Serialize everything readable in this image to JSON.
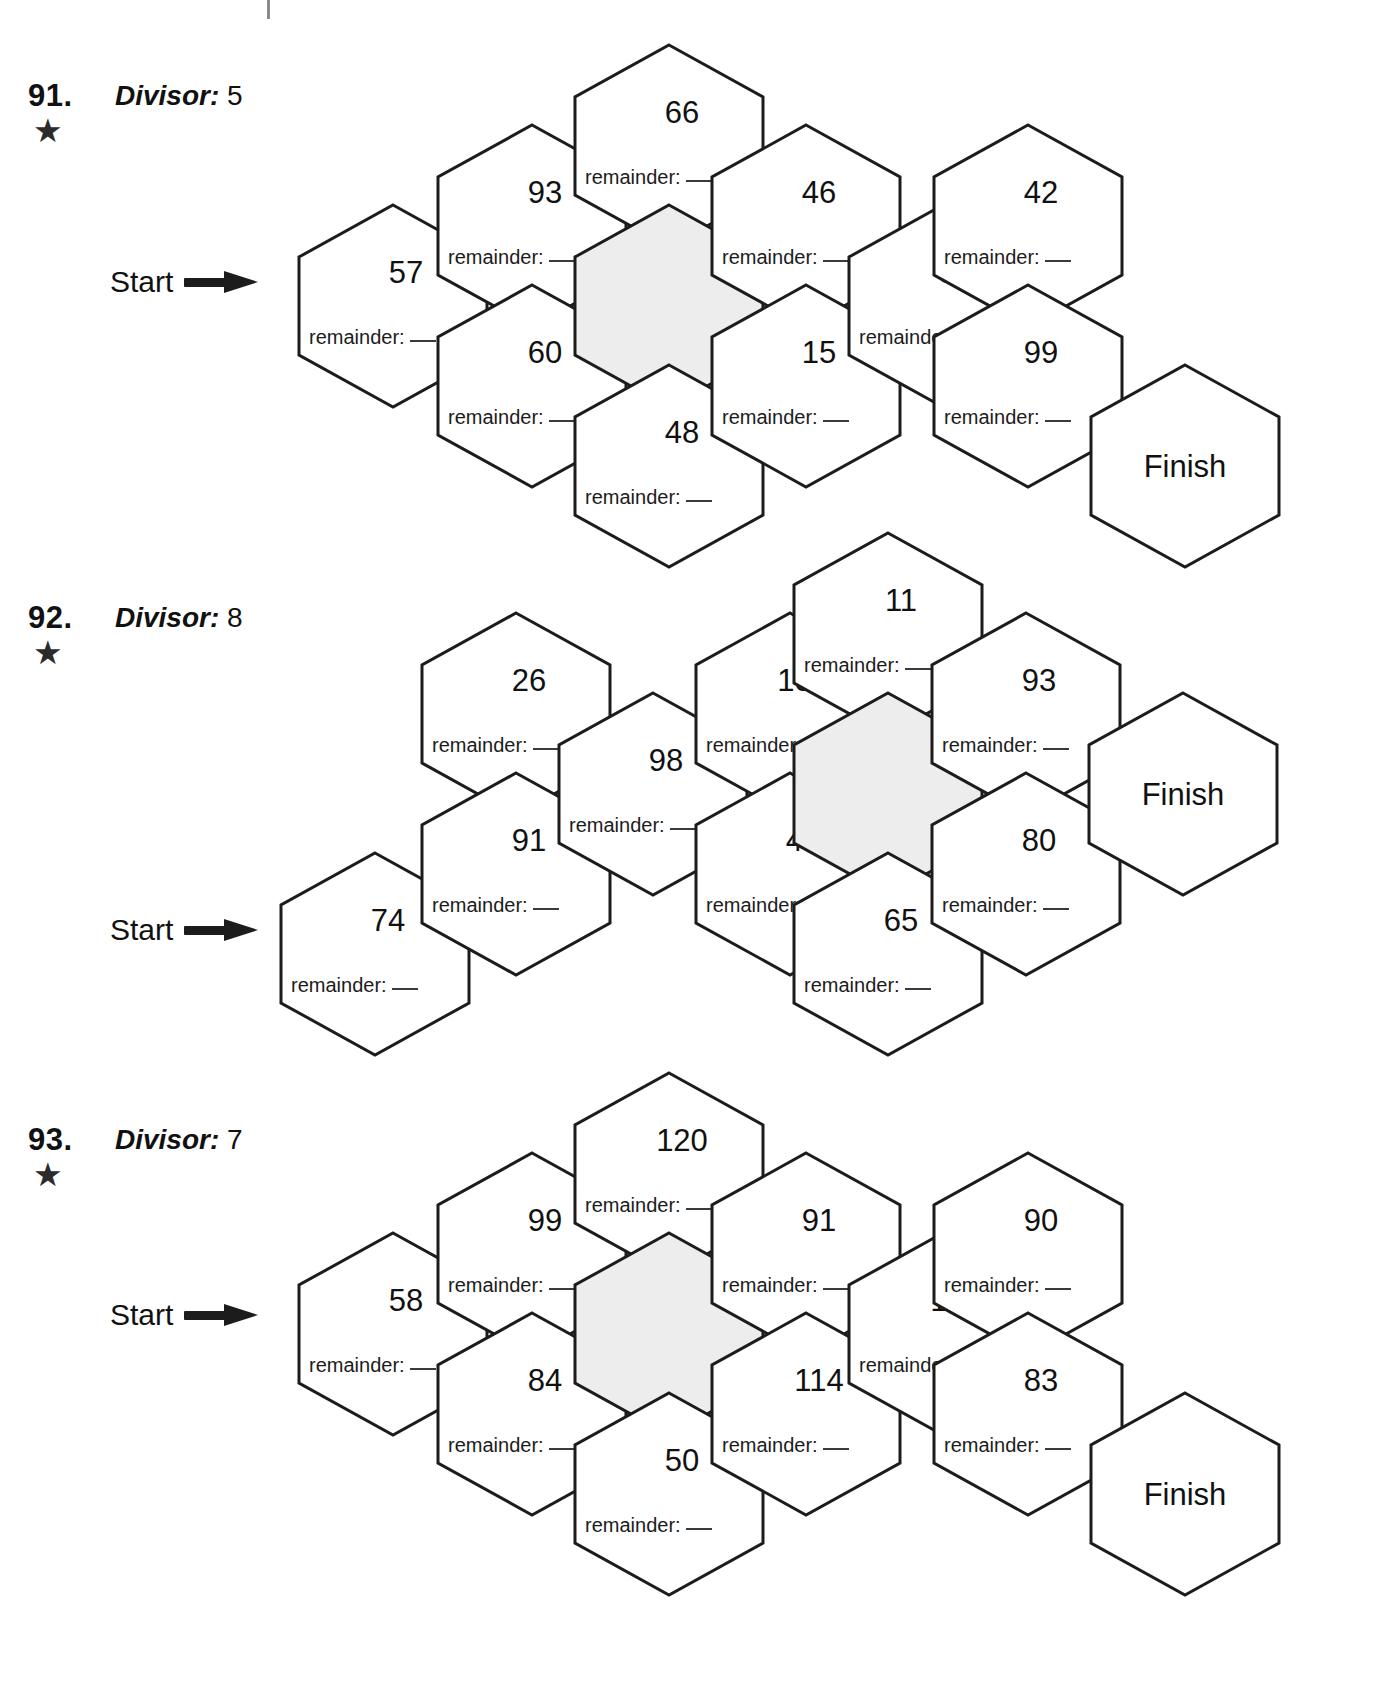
{
  "page": {
    "registration_tick": "crop-mark",
    "remainder_label": "remainder:",
    "start_label": "Start",
    "finish_label": "Finish",
    "star_glyph": "★",
    "divisor_word": "Divisor:",
    "shaded_fill": "#ededed",
    "stroke_color": "#1c1c1c",
    "text_color": "#111111"
  },
  "puzzles": [
    {
      "number": "91.",
      "star": "★",
      "divisor_label": "Divisor:",
      "divisor_value": "5",
      "start_label": "Start",
      "finish_label": "Finish",
      "hexes": [
        {
          "value": "57",
          "shaded": false,
          "finish": false
        },
        {
          "value": "93",
          "shaded": false,
          "finish": false
        },
        {
          "value": "60",
          "shaded": false,
          "finish": false
        },
        {
          "value": "66",
          "shaded": false,
          "finish": false
        },
        {
          "value": "",
          "shaded": true,
          "finish": false
        },
        {
          "value": "48",
          "shaded": false,
          "finish": false
        },
        {
          "value": "46",
          "shaded": false,
          "finish": false
        },
        {
          "value": "15",
          "shaded": false,
          "finish": false
        },
        {
          "value": "34",
          "shaded": false,
          "finish": false
        },
        {
          "value": "42",
          "shaded": false,
          "finish": false
        },
        {
          "value": "99",
          "shaded": false,
          "finish": false
        },
        {
          "value": "Finish",
          "shaded": false,
          "finish": true
        }
      ]
    },
    {
      "number": "92.",
      "star": "★",
      "divisor_label": "Divisor:",
      "divisor_value": "8",
      "start_label": "Start",
      "finish_label": "Finish",
      "hexes": [
        {
          "value": "74",
          "shaded": false,
          "finish": false
        },
        {
          "value": "26",
          "shaded": false,
          "finish": false
        },
        {
          "value": "91",
          "shaded": false,
          "finish": false
        },
        {
          "value": "98",
          "shaded": false,
          "finish": false
        },
        {
          "value": "104",
          "shaded": false,
          "finish": false
        },
        {
          "value": "49",
          "shaded": false,
          "finish": false
        },
        {
          "value": "11",
          "shaded": false,
          "finish": false
        },
        {
          "value": "",
          "shaded": true,
          "finish": false
        },
        {
          "value": "65",
          "shaded": false,
          "finish": false
        },
        {
          "value": "93",
          "shaded": false,
          "finish": false
        },
        {
          "value": "80",
          "shaded": false,
          "finish": false
        },
        {
          "value": "Finish",
          "shaded": false,
          "finish": true
        }
      ]
    },
    {
      "number": "93.",
      "star": "★",
      "divisor_label": "Divisor:",
      "divisor_value": "7",
      "start_label": "Start",
      "finish_label": "Finish",
      "hexes": [
        {
          "value": "58",
          "shaded": false,
          "finish": false
        },
        {
          "value": "99",
          "shaded": false,
          "finish": false
        },
        {
          "value": "84",
          "shaded": false,
          "finish": false
        },
        {
          "value": "120",
          "shaded": false,
          "finish": false
        },
        {
          "value": "",
          "shaded": true,
          "finish": false
        },
        {
          "value": "50",
          "shaded": false,
          "finish": false
        },
        {
          "value": "91",
          "shaded": false,
          "finish": false
        },
        {
          "value": "114",
          "shaded": false,
          "finish": false
        },
        {
          "value": "101",
          "shaded": false,
          "finish": false
        },
        {
          "value": "90",
          "shaded": false,
          "finish": false
        },
        {
          "value": "83",
          "shaded": false,
          "finish": false
        },
        {
          "value": "Finish",
          "shaded": false,
          "finish": true
        }
      ]
    }
  ],
  "layout": {
    "puzzle_tops": [
      0,
      540,
      1068
    ],
    "label_tops": [
      78,
      600,
      1122
    ],
    "start_tops": [
      265,
      913,
      1298
    ],
    "start_lefts": [
      110,
      110,
      110
    ],
    "hex_positions": [
      [
        [
          295,
          203
        ],
        [
          434,
          123
        ],
        [
          434,
          283
        ],
        [
          571,
          43
        ],
        [
          571,
          203
        ],
        [
          571,
          363
        ],
        [
          708,
          123
        ],
        [
          708,
          283
        ],
        [
          845,
          203
        ],
        [
          930,
          123
        ],
        [
          930,
          283
        ],
        [
          1087,
          363
        ]
      ],
      [
        [
          277,
          851
        ],
        [
          418,
          611
        ],
        [
          418,
          771
        ],
        [
          555,
          691
        ],
        [
          692,
          611
        ],
        [
          692,
          771
        ],
        [
          790,
          531
        ],
        [
          790,
          691
        ],
        [
          790,
          851
        ],
        [
          928,
          611
        ],
        [
          928,
          771
        ],
        [
          1085,
          691
        ]
      ],
      [
        [
          295,
          1231
        ],
        [
          434,
          1151
        ],
        [
          434,
          1311
        ],
        [
          571,
          1071
        ],
        [
          571,
          1231
        ],
        [
          571,
          1391
        ],
        [
          708,
          1151
        ],
        [
          708,
          1311
        ],
        [
          845,
          1231
        ],
        [
          930,
          1151
        ],
        [
          930,
          1311
        ],
        [
          1087,
          1391
        ]
      ]
    ]
  }
}
